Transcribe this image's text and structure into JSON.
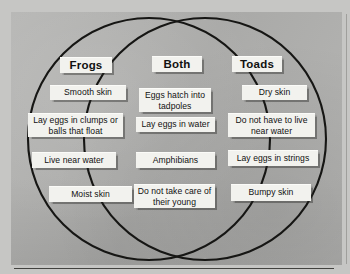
{
  "diagram": {
    "type": "venn",
    "background_color": "#b2b2b0",
    "paper_color": "#c6c6c4",
    "box_color": "#f2f2ee",
    "stroke_color": "#161614",
    "circles": [
      {
        "name": "Frogs",
        "cx": 149,
        "cy": 139,
        "r": 121
      },
      {
        "name": "Toads",
        "cx": 205,
        "cy": 139,
        "r": 121
      }
    ],
    "sections": [
      {
        "id": "frogs",
        "title": "Frogs",
        "items": [
          "Smooth skin",
          "Lay eggs in clumps or balls that float",
          "Live near water",
          "Moist skin"
        ]
      },
      {
        "id": "both",
        "title": "Both",
        "items": [
          "Eggs hatch into tadpoles",
          "Lay eggs in water",
          "Amphibians",
          "Do not take care of their young"
        ]
      },
      {
        "id": "toads",
        "title": "Toads",
        "items": [
          "Dry skin",
          "Do not have to live near water",
          "Lay eggs in strings",
          "Bumpy skin"
        ]
      }
    ]
  }
}
